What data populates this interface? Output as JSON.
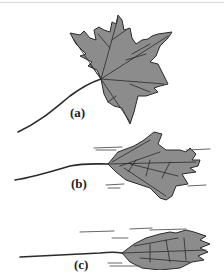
{
  "figure": {
    "panels": [
      {
        "id": "a",
        "label": "(a)",
        "description": "maple leaf at rest, flat"
      },
      {
        "id": "b",
        "label": "(b)",
        "description": "maple leaf bending in wind"
      },
      {
        "id": "c",
        "label": "(c)",
        "description": "maple leaf rolled into streamlined cone in strong wind"
      }
    ]
  },
  "colors": {
    "leaf_fill": "#8c8c8c",
    "outline": "#2a2a2a",
    "background": "#ffffff"
  }
}
